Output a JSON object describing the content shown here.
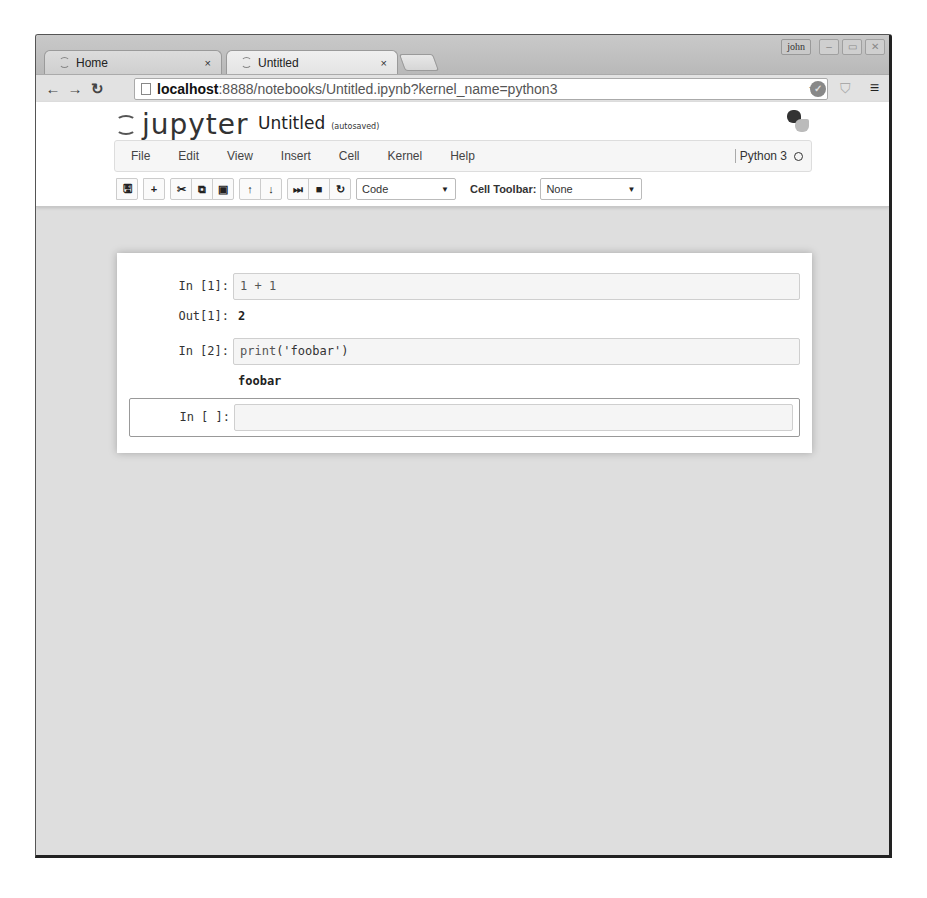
{
  "browser": {
    "tabs": [
      {
        "label": "Home",
        "close": "×",
        "active": false
      },
      {
        "label": "Untitled",
        "close": "×",
        "active": true
      }
    ],
    "user_badge": "john",
    "window_controls": {
      "minimize": "–",
      "maximize": "▭",
      "close": "✕"
    },
    "nav": {
      "back": "←",
      "forward": "→",
      "reload": "↻"
    },
    "url": {
      "host": "localhost",
      "rest": ":8888/notebooks/Untitled.ipynb?kernel_name=python3"
    },
    "star": "☆",
    "menu": "≡"
  },
  "jupyter": {
    "logo_text": "jupyter",
    "notebook_name": "Untitled",
    "save_status": "(autosaved)",
    "menu": [
      "File",
      "Edit",
      "View",
      "Insert",
      "Cell",
      "Kernel",
      "Help"
    ],
    "kernel_name": "Python 3",
    "toolbar": {
      "save": "🖫",
      "insert": "+",
      "cut": "✂",
      "copy": "⧉",
      "paste": "▣",
      "move_up": "↑",
      "move_down": "↓",
      "run": "⏭",
      "stop": "■",
      "restart": "↻",
      "cell_type": "Code",
      "cell_toolbar_label": "Cell Toolbar:",
      "cell_toolbar_value": "None",
      "dropdown_arrow": "▼"
    }
  },
  "cells": [
    {
      "prompt": "In [1]:",
      "source": "1 + 1",
      "out_prompt": "Out[1]:",
      "output": "2"
    },
    {
      "prompt": "In [2]:",
      "source_fn": "print",
      "source_args": "('foobar')",
      "output": "foobar"
    },
    {
      "prompt": "In [ ]:",
      "source": ""
    }
  ]
}
